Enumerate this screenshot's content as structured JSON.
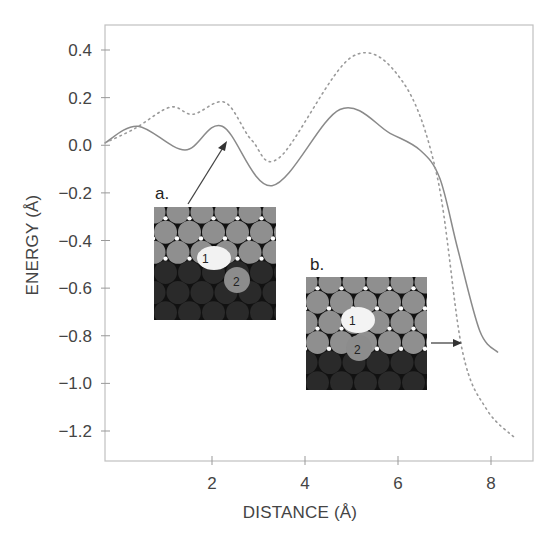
{
  "chart_data": {
    "type": "line",
    "title": "",
    "xlabel": "DISTANCE (Å)",
    "ylabel": "ENERGY (Å)",
    "xlim": [
      -0.3,
      8.9
    ],
    "ylim": [
      -1.32,
      0.5
    ],
    "xticks": [
      2,
      4,
      6,
      8
    ],
    "xtick_labels": [
      "2",
      "4",
      "6",
      "8"
    ],
    "yticks": [
      0.4,
      0.2,
      0.0,
      -0.2,
      -0.4,
      -0.6,
      -0.8,
      -1.0,
      -1.2
    ],
    "ytick_labels": [
      "0.4",
      "0.2",
      "0.0",
      "−0.2",
      "−0.4",
      "−0.6",
      "−0.8",
      "−1.0",
      "−1.2"
    ],
    "grid": false,
    "legend": null,
    "series": [
      {
        "name": "solid",
        "style": "solid",
        "color": "#8a8a8a",
        "x": [
          -0.3,
          0.41,
          1.42,
          2.22,
          3.29,
          4.75,
          5.83,
          6.47,
          6.9,
          7.29,
          7.76,
          8.15
        ],
        "y": [
          0.01,
          0.08,
          -0.02,
          0.08,
          -0.17,
          0.15,
          0.05,
          -0.02,
          -0.14,
          -0.44,
          -0.78,
          -0.87
        ]
      },
      {
        "name": "dotted",
        "style": "dotted",
        "color": "#9a9a9a",
        "x": [
          -0.3,
          0.34,
          1.1,
          1.59,
          2.28,
          2.86,
          3.46,
          5.0,
          6.09,
          6.84,
          7.38,
          7.91,
          8.52
        ],
        "y": [
          0.01,
          0.07,
          0.16,
          0.13,
          0.18,
          0.02,
          -0.05,
          0.37,
          0.27,
          -0.13,
          -0.86,
          -1.11,
          -1.23
        ]
      }
    ],
    "annotations": [
      {
        "label": "a.",
        "arrow_to": [
          2.3,
          0.01
        ],
        "description": "inset a: atomic surface configuration with atoms 1 and 2"
      },
      {
        "label": "b.",
        "arrow_to": [
          8.0,
          -0.84
        ],
        "description": "inset b: atomic surface configuration with atoms 1 and 2"
      }
    ]
  },
  "insets": {
    "a": {
      "label": "a.",
      "atom1": "1",
      "atom2": "2"
    },
    "b": {
      "label": "b.",
      "atom1": "1",
      "atom2": "2"
    }
  },
  "colors": {
    "axis": "#b5b5b5",
    "light_atom": "#8f8f8f",
    "dark_atom": "#2a2a2a",
    "highlight_atom": "#f4f4f4"
  }
}
